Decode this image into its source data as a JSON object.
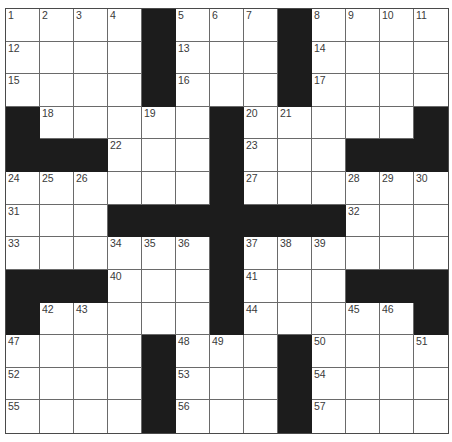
{
  "puzzle": {
    "rows": 13,
    "cols": 13,
    "block_color": "#1c1c1c",
    "grid_line_color": "#6a6a6a",
    "number_color": "#3a3a3a",
    "layout": [
      "....#...#....",
      "....#...#....",
      "....#...#....",
      "#.....#.....#",
      "###...#...###",
      "......#......",
      "...#######...",
      "......#......",
      "###...#...###",
      "#.....#.....#",
      "....#...#....",
      "....#...#....",
      "....#...#...."
    ],
    "numbers": [
      [
        1,
        2,
        3,
        4,
        null,
        5,
        6,
        7,
        null,
        8,
        9,
        10,
        11
      ],
      [
        12,
        null,
        null,
        null,
        null,
        13,
        null,
        null,
        null,
        14,
        null,
        null,
        null
      ],
      [
        15,
        null,
        null,
        null,
        null,
        16,
        null,
        null,
        null,
        17,
        null,
        null,
        null
      ],
      [
        null,
        18,
        null,
        null,
        19,
        null,
        null,
        20,
        21,
        null,
        null,
        null,
        null
      ],
      [
        null,
        null,
        null,
        22,
        null,
        null,
        null,
        23,
        null,
        null,
        null,
        null,
        null
      ],
      [
        24,
        25,
        26,
        null,
        null,
        null,
        null,
        27,
        null,
        null,
        28,
        29,
        30
      ],
      [
        31,
        null,
        null,
        null,
        null,
        null,
        null,
        null,
        null,
        null,
        32,
        null,
        null
      ],
      [
        33,
        null,
        null,
        34,
        35,
        36,
        null,
        37,
        38,
        39,
        null,
        null,
        null
      ],
      [
        null,
        null,
        null,
        40,
        null,
        null,
        null,
        41,
        null,
        null,
        null,
        null,
        null
      ],
      [
        null,
        42,
        43,
        null,
        null,
        null,
        null,
        44,
        null,
        null,
        45,
        46,
        null
      ],
      [
        47,
        null,
        null,
        null,
        null,
        48,
        49,
        null,
        null,
        50,
        null,
        null,
        51
      ],
      [
        52,
        null,
        null,
        null,
        null,
        53,
        null,
        null,
        null,
        54,
        null,
        null,
        null
      ],
      [
        55,
        null,
        null,
        null,
        null,
        56,
        null,
        null,
        null,
        57,
        null,
        null,
        null
      ]
    ],
    "entries": [
      [
        "",
        "",
        "",
        "",
        "",
        "",
        "",
        "",
        "",
        "",
        "",
        "",
        ""
      ],
      [
        "",
        "",
        "",
        "",
        "",
        "",
        "",
        "",
        "",
        "",
        "",
        "",
        ""
      ],
      [
        "",
        "",
        "",
        "",
        "",
        "",
        "",
        "",
        "",
        "",
        "",
        "",
        ""
      ],
      [
        "",
        "",
        "",
        "",
        "",
        "",
        "",
        "",
        "",
        "",
        "",
        "",
        ""
      ],
      [
        "",
        "",
        "",
        "",
        "",
        "",
        "",
        "",
        "",
        "",
        "",
        "",
        ""
      ],
      [
        "",
        "",
        "",
        "",
        "",
        "",
        "",
        "",
        "",
        "",
        "",
        "",
        ""
      ],
      [
        "",
        "",
        "",
        "",
        "",
        "",
        "",
        "",
        "",
        "",
        "",
        "",
        ""
      ],
      [
        "",
        "",
        "",
        "",
        "",
        "",
        "",
        "",
        "",
        "",
        "",
        "",
        ""
      ],
      [
        "",
        "",
        "",
        "",
        "",
        "",
        "",
        "",
        "",
        "",
        "",
        "",
        ""
      ],
      [
        "",
        "",
        "",
        "",
        "",
        "",
        "",
        "",
        "",
        "",
        "",
        "",
        ""
      ],
      [
        "",
        "",
        "",
        "",
        "",
        "",
        "",
        "",
        "",
        "",
        "",
        "",
        ""
      ],
      [
        "",
        "",
        "",
        "",
        "",
        "",
        "",
        "",
        "",
        "",
        "",
        "",
        ""
      ],
      [
        "",
        "",
        "",
        "",
        "",
        "",
        "",
        "",
        "",
        "",
        "",
        "",
        ""
      ]
    ]
  }
}
